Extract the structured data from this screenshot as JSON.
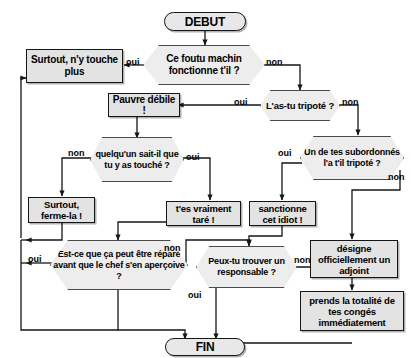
{
  "diagram": {
    "language": "fr",
    "colors": {
      "process_fill": "#e3e3e3",
      "decision_fill": "#ededed",
      "terminator_fill": "#e8e8e8",
      "stroke": "#161616",
      "background": "#ffffff"
    },
    "nodes": {
      "start": {
        "label": "DEBUT",
        "shape": "terminator"
      },
      "q_fonctionne": {
        "label": "Ce foutu machin fonctionne t'il ?",
        "shape": "decision"
      },
      "surtout_ny_touche": {
        "label": "Surtout, n'y touche plus",
        "shape": "process"
      },
      "q_astu_tripote": {
        "label": "L'as-tu tripoté ?",
        "shape": "decision"
      },
      "pauvre_debile": {
        "label": "Pauvre débile !",
        "shape": "process"
      },
      "q_quelquun_sait": {
        "label": "quelqu'un sait-il que tu y as touché ?",
        "shape": "decision"
      },
      "q_subordonnes": {
        "label": "Un de tes subordonnés l'a t'il tripoté ?",
        "shape": "decision"
      },
      "surtout_ferme_la": {
        "label": "Surtout, ferme-la !",
        "shape": "process"
      },
      "tes_vraiment_tare": {
        "label": "t'es vraiment taré !",
        "shape": "process"
      },
      "sanctionne_idiot": {
        "label": "sanctionne cet idiot !",
        "shape": "process"
      },
      "q_repare": {
        "label": "Est-ce que ça peut être réparé avant que le chef s'en aperçoive ?",
        "shape": "decision"
      },
      "q_responsable": {
        "label": "Peux-tu trouver un responsable ?",
        "shape": "decision"
      },
      "designe_adjoint": {
        "label": "désigne officiellement un adjoint",
        "shape": "process"
      },
      "prends_conges": {
        "label": "prends la totalité de tes congés immédiatement",
        "shape": "process"
      },
      "end": {
        "label": "FIN",
        "shape": "terminator"
      }
    },
    "edge_labels": {
      "fonctionne_oui": "oui",
      "fonctionne_non": "non",
      "astu_oui": "oui",
      "astu_non": "non",
      "quelquun_non": "non",
      "quelquun_oui": "oui",
      "subordonnes_oui": "oui",
      "subordonnes_non": "non",
      "repare_oui": "oui",
      "repare_non": "non",
      "responsable_oui": "oui",
      "responsable_non": "non"
    }
  }
}
